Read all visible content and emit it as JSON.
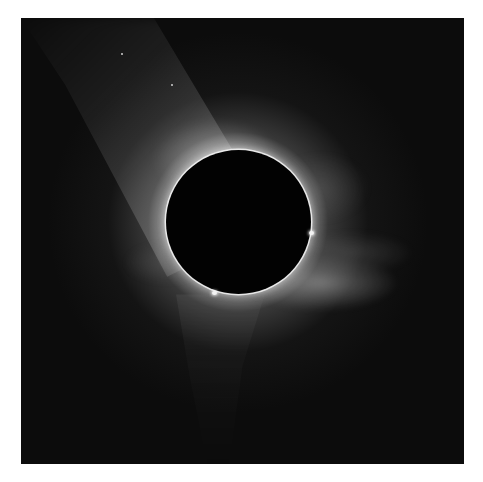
{
  "image": {
    "subject": "total solar eclipse corona",
    "colors": {
      "background": "#ffffff",
      "sky": "#0c0c0c",
      "moon": "#020202",
      "corona": "#dcdcdc"
    }
  }
}
